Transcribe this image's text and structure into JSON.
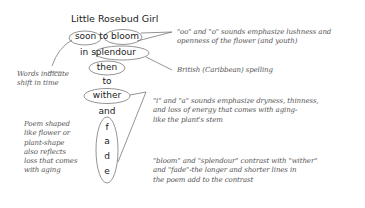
{
  "title": "Little Rosebud Girl",
  "poem": {
    "lines": [
      "soon to bloom",
      "in splendour",
      "then",
      "to",
      "wither",
      "and",
      "f",
      "a",
      "d",
      "e"
    ]
  },
  "annotations": {
    "sounds_oo_o": "\"oo\" and \"o\" sounds emphasize lushness and\nopenness of the flower (and youth)",
    "british_spelling": "British (Caribbean) spelling",
    "shift_in_time": "Words indicate\nshift in time",
    "sounds_i_a": "\"i\" and \"a\" sounds emphasize dryness, thinness,\nand loss of energy that comes with aging-\nlike the plant's stem",
    "shape": "Poem shaped\nlike flower or\nplant-shape\nalso reflects\nloss that comes\nwith aging",
    "contrast": "\"bloom\" and \"splendour\" contrast with \"wither\"\nand \"fade\"-the longer and shorter lines in\nthe poem add to the contrast"
  },
  "colors": {
    "ink": "#222222",
    "annotation": "#555555",
    "line": "#666666"
  }
}
